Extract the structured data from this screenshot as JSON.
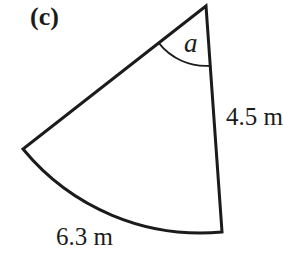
{
  "figure": {
    "part_label": "(c)",
    "angle_label": "a",
    "radius_label": "4.5 m",
    "arc_length_label": "6.3 m"
  },
  "colors": {
    "line": "#1b1b1b",
    "background": "#ffffff"
  }
}
